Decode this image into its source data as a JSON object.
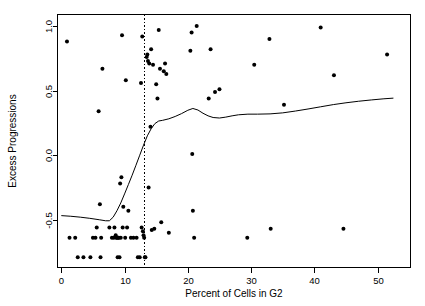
{
  "chart_data": {
    "type": "scatter",
    "title": "",
    "xlabel": "Percent of Cells in G2",
    "ylabel": "Excess Progressions",
    "xlim": [
      -0.6,
      55.2
    ],
    "ylim": [
      -0.87,
      1.09
    ],
    "xticks": [
      0,
      10,
      20,
      30,
      40,
      50
    ],
    "xtick_labels": [
      "0",
      "10",
      "20",
      "30",
      "40",
      "50"
    ],
    "yticks": [
      -0.5,
      0.0,
      0.5,
      1.0
    ],
    "ytick_labels": [
      "-0.5",
      "0.0",
      "0.5",
      "1.0"
    ],
    "grid": false,
    "legend": null,
    "point_color": "#000000",
    "line_color": "#000000",
    "background": "#ffffff",
    "annotations": [
      {
        "name": "threshold-vline",
        "type": "vertical-dashed-line",
        "x": 13.0,
        "style": "dotted"
      }
    ],
    "series": [
      {
        "name": "Excess Progressions vs Percent of Cells in G2",
        "type": "scatter",
        "marker": "filled-circle",
        "points": [
          [
            0.9,
            0.88
          ],
          [
            1.3,
            -0.64
          ],
          [
            2.2,
            -0.64
          ],
          [
            2.6,
            -0.79
          ],
          [
            3.5,
            -0.79
          ],
          [
            4.6,
            -0.79
          ],
          [
            5.0,
            -0.64
          ],
          [
            5.4,
            -0.64
          ],
          [
            5.6,
            -0.56
          ],
          [
            5.9,
            0.34
          ],
          [
            6.1,
            -0.38
          ],
          [
            6.2,
            -0.79
          ],
          [
            6.3,
            -0.64
          ],
          [
            6.5,
            0.67
          ],
          [
            7.6,
            -0.56
          ],
          [
            8.0,
            -0.64
          ],
          [
            8.3,
            -0.64
          ],
          [
            8.4,
            -0.56
          ],
          [
            8.6,
            -0.62
          ],
          [
            8.7,
            -0.64
          ],
          [
            8.8,
            -0.64
          ],
          [
            8.9,
            -0.79
          ],
          [
            9.0,
            -0.64
          ],
          [
            9.1,
            -0.64
          ],
          [
            9.2,
            -0.79
          ],
          [
            9.3,
            -0.22
          ],
          [
            9.4,
            -0.64
          ],
          [
            9.5,
            -0.17
          ],
          [
            9.6,
            0.93
          ],
          [
            9.7,
            -0.56
          ],
          [
            9.8,
            -0.4
          ],
          [
            10.1,
            -0.64
          ],
          [
            10.2,
            0.58
          ],
          [
            10.4,
            -0.56
          ],
          [
            10.6,
            -0.43
          ],
          [
            11.0,
            -0.64
          ],
          [
            11.4,
            -0.64
          ],
          [
            11.9,
            -0.64
          ],
          [
            12.1,
            -0.79
          ],
          [
            12.4,
            -0.79
          ],
          [
            12.6,
            0.56
          ],
          [
            12.7,
            -0.56
          ],
          [
            12.8,
            0.92
          ],
          [
            12.9,
            -0.59
          ],
          [
            13.0,
            -0.62
          ],
          [
            13.1,
            -0.64
          ],
          [
            13.2,
            -0.79
          ],
          [
            13.3,
            -0.79
          ],
          [
            13.5,
            0.76
          ],
          [
            13.6,
            0.78
          ],
          [
            13.7,
            0.73
          ],
          [
            13.8,
            -0.25
          ],
          [
            13.9,
            0.71
          ],
          [
            14.1,
            0.22
          ],
          [
            14.2,
            0.82
          ],
          [
            14.3,
            -0.58
          ],
          [
            14.5,
            0.7
          ],
          [
            14.7,
            -0.57
          ],
          [
            15.0,
            0.55
          ],
          [
            15.2,
            0.44
          ],
          [
            15.4,
            0.97
          ],
          [
            15.6,
            0.67
          ],
          [
            15.8,
            -0.52
          ],
          [
            16.2,
            0.65
          ],
          [
            16.4,
            0.71
          ],
          [
            16.6,
            0.63
          ],
          [
            17.0,
            -0.6
          ],
          [
            20.4,
            0.81
          ],
          [
            20.6,
            0.95
          ],
          [
            20.7,
            0.01
          ],
          [
            20.8,
            -0.43
          ],
          [
            21.0,
            -0.64
          ],
          [
            21.4,
            1.0
          ],
          [
            23.3,
            0.44
          ],
          [
            23.6,
            0.82
          ],
          [
            24.3,
            0.49
          ],
          [
            25.0,
            0.51
          ],
          [
            29.4,
            -0.64
          ],
          [
            30.5,
            0.7
          ],
          [
            32.9,
            0.9
          ],
          [
            33.1,
            -0.57
          ],
          [
            35.2,
            0.39
          ],
          [
            41.0,
            0.99
          ],
          [
            43.1,
            0.62
          ],
          [
            44.6,
            -0.57
          ],
          [
            51.5,
            0.78
          ]
        ]
      },
      {
        "name": "loess smoother",
        "type": "line",
        "points": [
          [
            0.0,
            -0.468
          ],
          [
            1.5,
            -0.473
          ],
          [
            3.0,
            -0.48
          ],
          [
            4.5,
            -0.489
          ],
          [
            6.0,
            -0.5
          ],
          [
            7.0,
            -0.508
          ],
          [
            7.6,
            -0.508
          ],
          [
            8.2,
            -0.48
          ],
          [
            8.8,
            -0.43
          ],
          [
            9.4,
            -0.37
          ],
          [
            10.0,
            -0.3
          ],
          [
            10.6,
            -0.228
          ],
          [
            11.2,
            -0.155
          ],
          [
            11.8,
            -0.078
          ],
          [
            12.4,
            0.0
          ],
          [
            13.0,
            0.078
          ],
          [
            13.6,
            0.15
          ],
          [
            14.2,
            0.205
          ],
          [
            14.8,
            0.245
          ],
          [
            15.4,
            0.265
          ],
          [
            16.0,
            0.27
          ],
          [
            17.0,
            0.282
          ],
          [
            18.0,
            0.3
          ],
          [
            19.0,
            0.322
          ],
          [
            20.0,
            0.348
          ],
          [
            20.8,
            0.362
          ],
          [
            21.6,
            0.35
          ],
          [
            22.4,
            0.325
          ],
          [
            23.2,
            0.305
          ],
          [
            24.0,
            0.292
          ],
          [
            25.0,
            0.288
          ],
          [
            26.0,
            0.295
          ],
          [
            27.0,
            0.305
          ],
          [
            28.0,
            0.313
          ],
          [
            29.5,
            0.318
          ],
          [
            31.0,
            0.318
          ],
          [
            33.0,
            0.32
          ],
          [
            35.0,
            0.328
          ],
          [
            37.0,
            0.342
          ],
          [
            39.0,
            0.358
          ],
          [
            41.0,
            0.375
          ],
          [
            43.0,
            0.392
          ],
          [
            45.0,
            0.406
          ],
          [
            47.0,
            0.418
          ],
          [
            49.0,
            0.428
          ],
          [
            51.0,
            0.437
          ],
          [
            52.5,
            0.442
          ]
        ]
      }
    ]
  }
}
